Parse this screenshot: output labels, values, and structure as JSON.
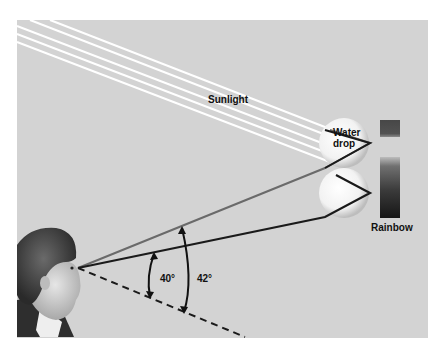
{
  "labels": {
    "sunlight": "Sunlight",
    "water_drop_line1": "Water",
    "water_drop_line2": "drop",
    "rainbow": "Rainbow",
    "angle_inner": "40°",
    "angle_outer": "42°"
  },
  "colors": {
    "panel": "#d2d2d2",
    "background": "#ffffff",
    "sun_rays": "#ffffff",
    "ray_dark": "#1a1a1a",
    "ray_gray": "#6a6a6a",
    "rainbow_top": "#4a4a4a",
    "rainbow_bottom": "#1e1e1e"
  }
}
